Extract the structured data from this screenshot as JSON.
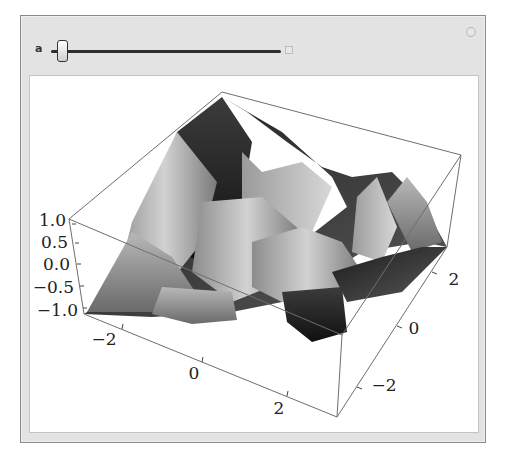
{
  "controls": {
    "parameter_label": "a",
    "slider_position_fraction": 0.04,
    "expand_icon": "plus-square-icon",
    "options_icon": "options-circle-icon"
  },
  "plot": {
    "type": "3d-surface",
    "shading": "grayscale",
    "z_ticks": [
      "1.0",
      "0.5",
      "0.0",
      "−0.5",
      "−1.0"
    ],
    "x_ticks": [
      "−2",
      "0",
      "2"
    ],
    "y_ticks": [
      "2",
      "0",
      "−2"
    ]
  },
  "colors": {
    "frame_bg": "#e3e3e3",
    "frame_border": "#8a8a8a",
    "panel_bg": "#ffffff",
    "box_edge": "#6e6e6e"
  }
}
